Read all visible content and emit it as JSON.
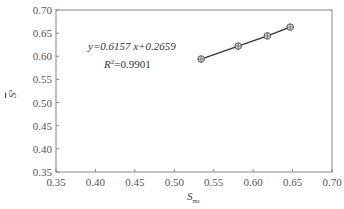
{
  "chart_data": {
    "type": "line",
    "title": "",
    "xlabel": "S_ms",
    "xlabel_main": "S",
    "xlabel_sub": "ms",
    "ylabel": "S̄_v^a",
    "ylabel_main": "S",
    "ylabel_sup": "a",
    "xlim": [
      0.35,
      0.7
    ],
    "ylim": [
      0.35,
      0.7
    ],
    "x_ticks": [
      "0.35",
      "0.40",
      "0.45",
      "0.50",
      "0.55",
      "0.60",
      "0.65",
      "0.70"
    ],
    "y_ticks": [
      "0.35",
      "0.40",
      "0.45",
      "0.50",
      "0.55",
      "0.60",
      "0.65",
      "0.70"
    ],
    "grid": false,
    "legend": null,
    "series": [
      {
        "name": "data",
        "marker": "circle-crosshair",
        "color": "#555555",
        "x": [
          0.534,
          0.581,
          0.618,
          0.647
        ],
        "y": [
          0.594,
          0.622,
          0.644,
          0.663
        ]
      }
    ],
    "annotations": [
      {
        "text": "y=0.6157 x+0.2659",
        "x": 0.425,
        "y": 0.619
      },
      {
        "text": "R²=0.9901",
        "x": 0.445,
        "y": 0.589
      }
    ]
  },
  "annotations": {
    "equation": "y=0.6157 x+0.2659",
    "r2_prefix": "R",
    "r2_sup": "2",
    "r2_value": "=0.9901"
  },
  "axes": {
    "xlabel_main": "S",
    "xlabel_sub": "ms",
    "ylabel_main": "S",
    "ylabel_sup": "a"
  }
}
